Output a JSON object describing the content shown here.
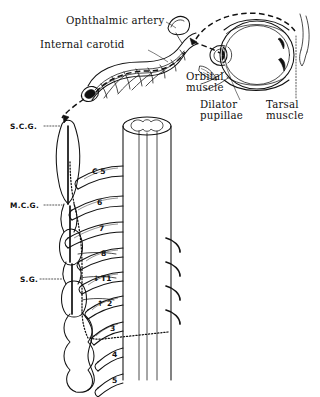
{
  "figure": {
    "ink_color": "#111111",
    "background_color": "#ffffff"
  },
  "labels": {
    "ophthalmic_artery": "Ophthalmic artery",
    "internal_carotid": "Internal carotid",
    "orbital_muscle_line1": "Orbital",
    "orbital_muscle_line2": "muscle",
    "dilator_pupillae_line1": "Dilator",
    "dilator_pupillae_line2": "pupillae",
    "tarsal_muscle_line1": "Tarsal",
    "tarsal_muscle_line2": "muscle",
    "superior_cervical_ganglion": "S.C.G.",
    "middle_cervical_ganglion": "M.C.G.",
    "stellate_ganglion": "S.G."
  },
  "segments": [
    {
      "id": "c5",
      "label": "C 5"
    },
    {
      "id": "c6",
      "label": "6"
    },
    {
      "id": "c7",
      "label": "7"
    },
    {
      "id": "c8",
      "label": "8"
    },
    {
      "id": "t1",
      "label": "T1",
      "arrow": "↓"
    },
    {
      "id": "t2",
      "label": "2",
      "arrow": "↑"
    },
    {
      "id": "t3",
      "label": "3"
    },
    {
      "id": "t4",
      "label": "4"
    },
    {
      "id": "t5",
      "label": "5"
    }
  ]
}
